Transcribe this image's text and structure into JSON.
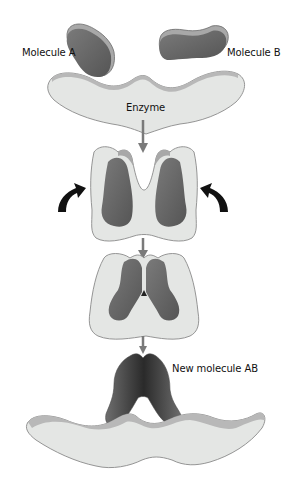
{
  "labels": {
    "molecule_a": "Molecule A",
    "molecule_b": "Molecule B",
    "enzyme": "Enzyme",
    "new_molecule": "New molecule AB"
  },
  "stages": [
    {
      "id": 1,
      "description": "Molecule A and Molecule B approach the enzyme"
    },
    {
      "id": 2,
      "description": "Molecules bind to the enzyme active sites; enzyme changes shape"
    },
    {
      "id": 3,
      "description": "Molecules are brought together and joined"
    },
    {
      "id": 4,
      "description": "New molecule AB is released; enzyme returns to original shape"
    }
  ],
  "colors": {
    "enzyme_fill": "#e4e6e4",
    "enzyme_edge": "#8a8a8a",
    "enzyme_rim": "#b8b8b8",
    "molecule_fill": "#6a6a6a",
    "molecule_rim": "#a8a8a8",
    "arrow": "#7a7a7a",
    "curved_arrow": "#111111"
  }
}
